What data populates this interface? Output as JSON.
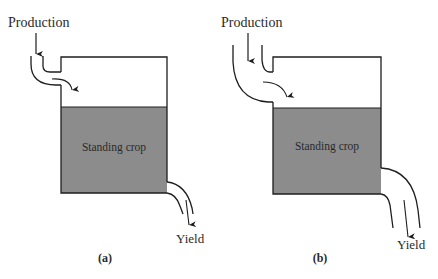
{
  "figure": {
    "panels": [
      {
        "id": "a",
        "caption": "(a)",
        "input_label": "Production",
        "stock_label": "Standing crop",
        "output_label": "Yield",
        "inlet_width": "narrow",
        "outlet_width": "narrow"
      },
      {
        "id": "b",
        "caption": "(b)",
        "input_label": "Production",
        "stock_label": "Standing crop",
        "output_label": "Yield",
        "inlet_width": "wide",
        "outlet_width": "wide"
      }
    ],
    "colors": {
      "standing_crop_fill": "#8c8c8c",
      "stroke": "#1e1e1e",
      "background": "#ffffff"
    }
  }
}
